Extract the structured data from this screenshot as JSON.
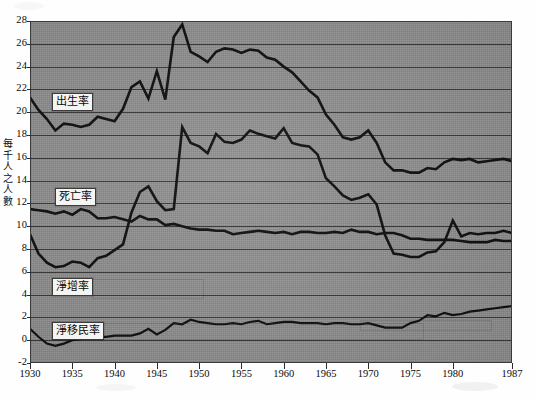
{
  "chart_data": {
    "type": "line",
    "title": "",
    "xlabel": "",
    "ylabel": "每千人之人數",
    "ylabel_chars": [
      "每",
      "千",
      "人",
      "之",
      "人",
      "數"
    ],
    "xlim": [
      1930,
      1987
    ],
    "ylim": [
      -2,
      28
    ],
    "ytick_step": 2,
    "grid": true,
    "legend_position": "inline-labels",
    "xticks": [
      "1930",
      "1935",
      "1940",
      "1945",
      "1950",
      "1955",
      "1960",
      "1965",
      "1970",
      "1975",
      "1980",
      "1987"
    ],
    "yticks": [
      "28",
      "26",
      "24",
      "22",
      "20",
      "18",
      "16",
      "14",
      "12",
      "10",
      "8",
      "6",
      "4",
      "2",
      "0",
      "-2"
    ],
    "x": [
      1930,
      1931,
      1932,
      1933,
      1934,
      1935,
      1936,
      1937,
      1938,
      1939,
      1940,
      1941,
      1942,
      1943,
      1944,
      1945,
      1946,
      1947,
      1948,
      1949,
      1950,
      1951,
      1952,
      1953,
      1954,
      1955,
      1956,
      1957,
      1958,
      1959,
      1960,
      1961,
      1962,
      1963,
      1964,
      1965,
      1966,
      1967,
      1968,
      1969,
      1970,
      1971,
      1972,
      1973,
      1974,
      1975,
      1976,
      1977,
      1978,
      1979,
      1980,
      1981,
      1982,
      1983,
      1984,
      1985,
      1986,
      1987
    ],
    "series": [
      {
        "name": "出生率",
        "name_en": "birth rate",
        "label_position": {
          "x": 52,
          "y": 93
        },
        "values": [
          21.3,
          20.2,
          19.4,
          18.4,
          19.0,
          18.9,
          18.7,
          18.9,
          19.6,
          19.4,
          19.2,
          20.3,
          22.2,
          22.7,
          21.2,
          23.6,
          21.1,
          26.6,
          27.7,
          25.3,
          24.9,
          24.4,
          25.3,
          25.6,
          25.5,
          25.2,
          25.5,
          25.4,
          24.8,
          24.6,
          24.0,
          23.5,
          22.7,
          21.9,
          21.3,
          19.8,
          18.9,
          17.8,
          17.6,
          17.8,
          18.4,
          17.3,
          15.6,
          14.9,
          14.9,
          14.7,
          14.7,
          15.1,
          15.0,
          15.6,
          15.9,
          15.8,
          15.9,
          15.6,
          15.7,
          15.8,
          15.9,
          15.7
        ]
      },
      {
        "name": "死亡率",
        "name_en": "death rate",
        "label_position": {
          "x": 55,
          "y": 188
        },
        "values": [
          11.5,
          11.4,
          11.3,
          11.1,
          11.3,
          11.0,
          11.5,
          11.3,
          10.7,
          10.7,
          10.8,
          10.6,
          10.4,
          10.9,
          10.6,
          10.6,
          10.1,
          10.2,
          10.0,
          9.8,
          9.7,
          9.7,
          9.6,
          9.6,
          9.3,
          9.4,
          9.5,
          9.6,
          9.5,
          9.4,
          9.5,
          9.3,
          9.5,
          9.5,
          9.4,
          9.4,
          9.5,
          9.4,
          9.7,
          9.5,
          9.5,
          9.3,
          9.4,
          9.4,
          9.2,
          8.9,
          8.9,
          8.8,
          8.8,
          8.8,
          8.8,
          8.7,
          8.6,
          8.6,
          8.6,
          8.8,
          8.7,
          8.7
        ]
      },
      {
        "name": "淨增率",
        "name_en": "net increase rate",
        "label_position": {
          "x": 52,
          "y": 278
        },
        "values": [
          9.3,
          7.6,
          6.8,
          6.4,
          6.5,
          6.9,
          6.8,
          6.4,
          7.2,
          7.4,
          7.9,
          8.4,
          11.2,
          13.0,
          13.5,
          12.2,
          11.4,
          11.5,
          18.7,
          17.3,
          17.0,
          16.4,
          18.1,
          17.4,
          17.3,
          17.6,
          18.4,
          18.1,
          17.9,
          17.7,
          18.6,
          17.3,
          17.1,
          17.0,
          16.3,
          14.2,
          13.5,
          12.7,
          12.3,
          12.5,
          12.8,
          11.9,
          9.2,
          7.6,
          7.5,
          7.3,
          7.3,
          7.7,
          7.8,
          8.6,
          10.5,
          9.1,
          9.4,
          9.3,
          9.4,
          9.4,
          9.6,
          9.4
        ]
      },
      {
        "name": "淨移民率",
        "name_en": "net migration rate",
        "label_position": {
          "x": 52,
          "y": 322
        },
        "values": [
          1.0,
          0.3,
          -0.3,
          -0.5,
          -0.3,
          0.0,
          0.1,
          0.2,
          0.3,
          0.3,
          0.4,
          0.4,
          0.4,
          0.6,
          1.0,
          0.5,
          0.9,
          1.5,
          1.4,
          1.8,
          1.6,
          1.5,
          1.4,
          1.4,
          1.5,
          1.4,
          1.6,
          1.7,
          1.4,
          1.5,
          1.6,
          1.6,
          1.5,
          1.5,
          1.5,
          1.4,
          1.5,
          1.5,
          1.4,
          1.4,
          1.5,
          1.3,
          1.1,
          1.1,
          1.1,
          1.5,
          1.7,
          2.2,
          2.1,
          2.4,
          2.2,
          2.3,
          2.5,
          2.6,
          2.7,
          2.8,
          2.9,
          3.0
        ]
      }
    ],
    "colors": {
      "background": "#8f8f8f",
      "gridline": "#2f2f2f",
      "line": "#0d0d0d",
      "label_box": "#f4f4f2",
      "page": "#fefefe"
    }
  }
}
